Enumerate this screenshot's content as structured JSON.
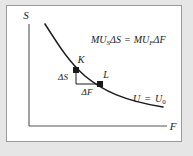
{
  "figure": {
    "name": "indifference-curve-diagram",
    "background_color": "#e6e6e6",
    "panel_color": "#ffffff",
    "border_color": "#9a9a9a",
    "ink_color": "#1a1a1a"
  },
  "axes": {
    "y_label": "S",
    "x_label": "F",
    "origin_x": 22,
    "origin_y": 120,
    "y_top": 18,
    "x_right": 160
  },
  "equation": {
    "mu_s": "MU",
    "mu_s_sub": "S",
    "delta_s": "ΔS",
    "equals": "=",
    "mu_f": "MU",
    "mu_f_sub": "F",
    "delta_f": "ΔF",
    "full_text": "MUₛΔS = MU꜀ΔF"
  },
  "curve": {
    "label_u": "U",
    "label_equals": "=",
    "label_u0": "U",
    "label_u0_sub": "0",
    "full_label": "U = U₀",
    "path": "M 38,18 C 52,40 62,56 78,70 C 96,85 118,95 156,101",
    "stroke_width": 1.6
  },
  "points": [
    {
      "id": "point-k",
      "label": "K",
      "x": 69,
      "y": 64,
      "label_dx": 4,
      "label_dy": -5
    },
    {
      "id": "point-l",
      "label": "L",
      "x": 93,
      "y": 78,
      "label_dx": 5,
      "label_dy": -4
    }
  ],
  "triangle": {
    "delta_s_label": "ΔS",
    "delta_f_label": "ΔF",
    "vertical_from_x": 69,
    "vertical_from_y": 64,
    "vertical_to_y": 78,
    "horizontal_to_x": 93,
    "delta_s_text_x": 54,
    "delta_s_text_y": 74,
    "delta_f_text_x": 73,
    "delta_f_text_y": 89
  },
  "equation_position": {
    "x": 84,
    "y": 37
  },
  "curve_label_position": {
    "x": 126,
    "y": 96
  }
}
